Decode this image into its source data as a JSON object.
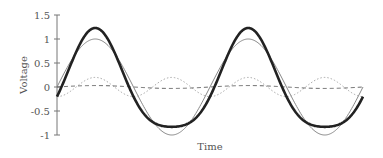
{
  "chart_data": {
    "type": "line",
    "title": "",
    "xlabel": "Time",
    "ylabel": "Voltage",
    "ylim": [
      -1,
      1.5
    ],
    "yticks": [
      1.5,
      1,
      0.5,
      0,
      -0.5,
      -1
    ],
    "ytick_labels": [
      "1.5",
      "1",
      "0.5",
      "0",
      "-0.5",
      "-1"
    ],
    "xticks": [],
    "grid": false,
    "legend": null,
    "x_range_periods": 2.0,
    "x": [
      0,
      0.25,
      0.5,
      0.75,
      1.0,
      1.25,
      1.5,
      1.75,
      2.0
    ],
    "series": [
      {
        "name": "fundamental",
        "style": "thin-solid",
        "color": "#888888",
        "values": [
          0,
          1,
          0,
          -1,
          0,
          1,
          0,
          -1,
          0
        ]
      },
      {
        "name": "second-harmonic",
        "style": "dotted",
        "color": "#aaaaaa",
        "values": [
          -0.2,
          0.2,
          -0.2,
          0.2,
          -0.2,
          0.2,
          -0.2,
          0.2,
          -0.2
        ]
      },
      {
        "name": "small-component",
        "style": "dashed",
        "color": "#666666",
        "values": [
          0,
          0.03,
          0,
          -0.03,
          0,
          0.03,
          0,
          -0.03,
          0
        ]
      },
      {
        "name": "sum",
        "style": "thick-solid",
        "color": "#222222",
        "values": [
          -0.2,
          1.23,
          -0.2,
          -0.83,
          -0.2,
          1.23,
          -0.2,
          -0.83,
          -0.2
        ]
      }
    ]
  }
}
